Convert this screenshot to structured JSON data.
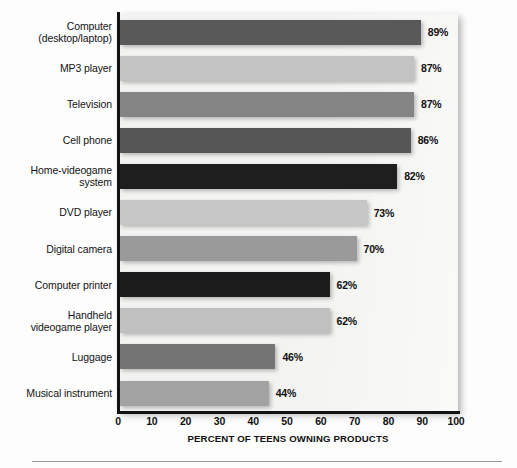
{
  "chart_data": {
    "type": "bar",
    "orientation": "horizontal",
    "title": "",
    "xlabel": "PERCENT OF TEENS OWNING PRODUCTS",
    "ylabel": "",
    "xlim": [
      0,
      100
    ],
    "grid": false,
    "legend": "none",
    "xticks": [
      "0",
      "10",
      "20",
      "30",
      "40",
      "50",
      "60",
      "70",
      "80",
      "90",
      "100"
    ],
    "xtick_values": [
      0,
      10,
      20,
      30,
      40,
      50,
      60,
      70,
      80,
      90,
      100
    ],
    "categories": [
      "Computer\n(desktop/laptop)",
      "MP3 player",
      "Television",
      "Cell phone",
      "Home-videogame\nsystem",
      "DVD player",
      "Digital camera",
      "Computer printer",
      "Handheld\nvideogame player",
      "Luggage",
      "Musical instrument"
    ],
    "values": [
      89,
      87,
      87,
      86,
      82,
      73,
      70,
      62,
      62,
      46,
      44
    ],
    "value_labels": [
      "89%",
      "87%",
      "87%",
      "86%",
      "82%",
      "73%",
      "70%",
      "62%",
      "62%",
      "46%",
      "44%"
    ],
    "bar_colors": [
      "#595959",
      "#c3c3c3",
      "#848484",
      "#565656",
      "#1e1e1e",
      "#c6c6c6",
      "#9a9a9a",
      "#1c1c1c",
      "#c0c0c0",
      "#747474",
      "#a2a2a2"
    ],
    "plot_background": "#f3f3f1",
    "axis_color": "#131313"
  }
}
